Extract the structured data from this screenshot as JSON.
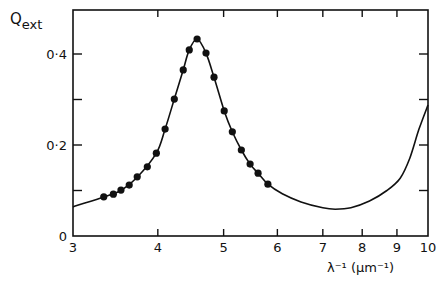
{
  "chart_data": {
    "type": "line",
    "title": "",
    "ylabel": "Q",
    "ylabel_sub": "ext",
    "xlabel": "λ⁻¹ (μm⁻¹)",
    "xscale": "log",
    "xlim": [
      3,
      10
    ],
    "ylim": [
      0,
      0.5
    ],
    "grid": false,
    "legend": null,
    "x_ticks": [
      3,
      4,
      5,
      6,
      7,
      8,
      9,
      10
    ],
    "x_tick_labels": [
      "3",
      "4",
      "5",
      "6",
      "7",
      "8",
      "9",
      "10"
    ],
    "y_ticks": [
      0,
      0.1,
      0.2,
      0.3,
      0.4
    ],
    "y_tick_labels": [
      "0",
      "",
      "0·2",
      "",
      "0·4"
    ],
    "series": [
      {
        "name": "measured",
        "style": "markers",
        "x": [
          3.33,
          3.44,
          3.53,
          3.63,
          3.73,
          3.86,
          3.98,
          4.1,
          4.23,
          4.36,
          4.45,
          4.57,
          4.71,
          4.84,
          5.01,
          5.15,
          5.31,
          5.47,
          5.62,
          5.81
        ],
        "y": [
          0.086,
          0.092,
          0.101,
          0.112,
          0.13,
          0.152,
          0.182,
          0.235,
          0.301,
          0.365,
          0.409,
          0.433,
          0.402,
          0.349,
          0.275,
          0.229,
          0.189,
          0.158,
          0.138,
          0.114
        ]
      },
      {
        "name": "calculated",
        "style": "line",
        "x": [
          3.0,
          3.33,
          3.53,
          3.73,
          3.98,
          4.1,
          4.23,
          4.36,
          4.45,
          4.57,
          4.71,
          4.84,
          5.01,
          5.15,
          5.31,
          5.47,
          5.62,
          5.81,
          6.1,
          6.5,
          7.0,
          7.3,
          7.7,
          8.2,
          8.7,
          9.1,
          9.4,
          9.7,
          10.0
        ],
        "y": [
          0.064,
          0.086,
          0.1,
          0.129,
          0.182,
          0.235,
          0.301,
          0.365,
          0.409,
          0.433,
          0.402,
          0.349,
          0.275,
          0.229,
          0.189,
          0.158,
          0.138,
          0.114,
          0.093,
          0.075,
          0.062,
          0.059,
          0.062,
          0.077,
          0.1,
          0.127,
          0.171,
          0.235,
          0.288
        ]
      }
    ]
  }
}
